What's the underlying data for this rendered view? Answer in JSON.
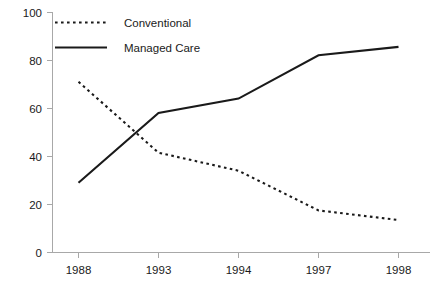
{
  "chart_data": {
    "type": "line",
    "title": "",
    "subtitle": "",
    "xlabel": "",
    "ylabel": "",
    "categories": [
      "1988",
      "1993",
      "1994",
      "1997",
      "1998"
    ],
    "x_tick_labels": [
      "1988",
      "1993",
      "1994",
      "1997",
      "1998"
    ],
    "y_tick_labels": [
      "0",
      "20",
      "40",
      "60",
      "80",
      "100"
    ],
    "y_ticks": [
      0,
      20,
      40,
      60,
      80,
      100
    ],
    "ylim": [
      0,
      100
    ],
    "grid": false,
    "legend_position": "top-left-inside",
    "series": [
      {
        "name": "Conventional",
        "style": "dashed",
        "color": "#1a1a1a",
        "values": [
          71,
          41.5,
          34,
          17.5,
          13.5
        ]
      },
      {
        "name": "Managed Care",
        "style": "solid",
        "color": "#1a1a1a",
        "values": [
          29,
          58,
          64,
          82,
          85.5
        ]
      }
    ],
    "legend": [
      {
        "label": "Conventional",
        "style": "dashed"
      },
      {
        "label": "Managed Care",
        "style": "solid"
      }
    ]
  },
  "axis": {
    "y_label_100": "100",
    "y_label_80": "80",
    "y_label_60": "60",
    "y_label_40": "40",
    "y_label_20": "20",
    "y_label_0": "0",
    "x_label_0": "1988",
    "x_label_1": "1993",
    "x_label_2": "1994",
    "x_label_3": "1997",
    "x_label_4": "1998"
  },
  "legend": {
    "item_0_label": "Conventional",
    "item_1_label": "Managed Care"
  },
  "colors": {
    "ink": "#1a1a1a",
    "axis": "#a8a8a8",
    "background": "#ffffff"
  }
}
